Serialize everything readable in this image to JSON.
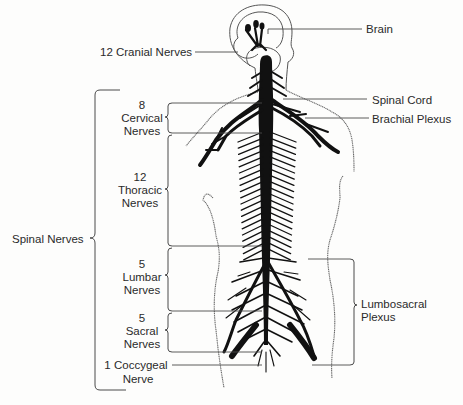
{
  "diagram": {
    "type": "anatomical-illustration"
  },
  "labels": {
    "brain": "Brain",
    "cranial": "12 Cranial Nerves",
    "spinal_cord": "Spinal Cord",
    "brachial": "Brachial Plexus",
    "spinal_nerves": "Spinal Nerves",
    "cervical": {
      "count": "8",
      "line1": "Cervical",
      "line2": "Nerves"
    },
    "thoracic": {
      "count": "12",
      "line1": "Thoracic",
      "line2": "Nerves"
    },
    "lumbar": {
      "count": "5",
      "line1": "Lumbar",
      "line2": "Nerves"
    },
    "sacral": {
      "count": "5",
      "line1": "Sacral",
      "line2": "Nerves"
    },
    "coccygeal": {
      "line1": "1 Coccygeal",
      "line2": "Nerve"
    },
    "lumbosacral": {
      "line1": "Lumbosacral",
      "line2": "Plexus"
    }
  },
  "colors": {
    "background": "#fdfdfc",
    "ink": "#111111",
    "text": "#2a2a2a",
    "lines": "#4a4a4a"
  }
}
